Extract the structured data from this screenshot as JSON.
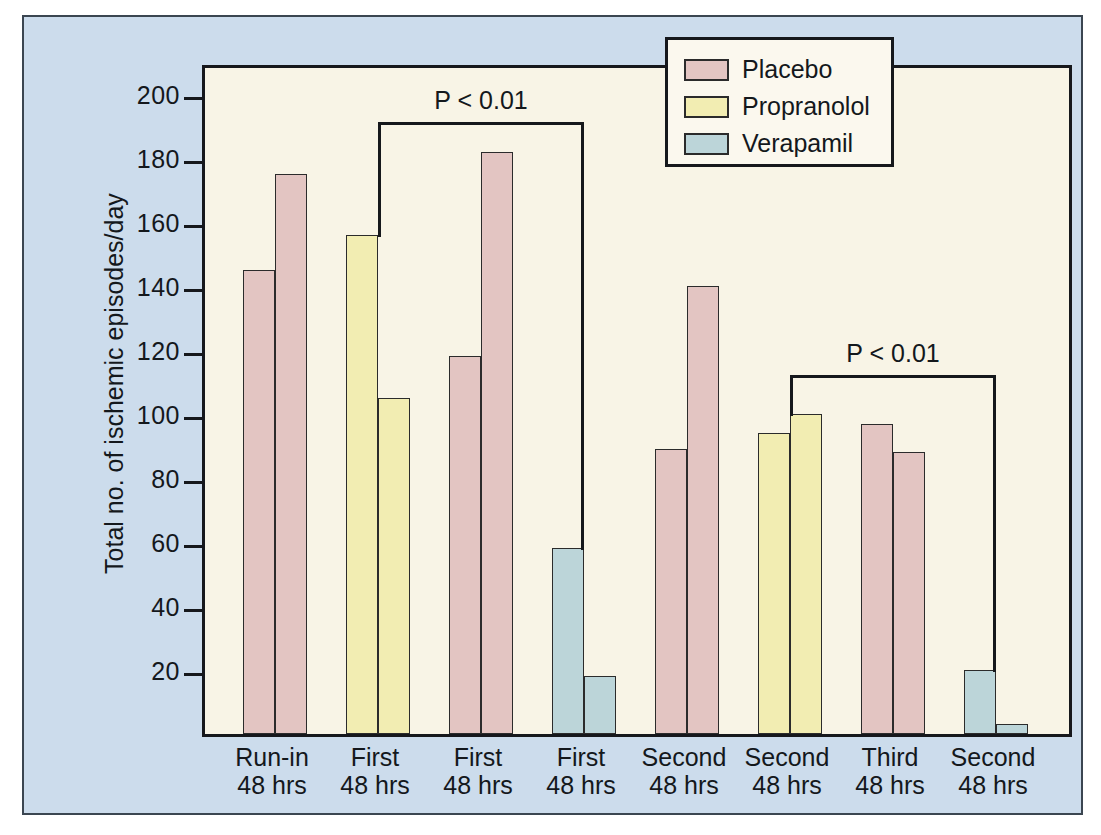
{
  "chart_data": {
    "type": "bar",
    "title": "",
    "xlabel": "",
    "ylabel": "Total no. of ischemic episodes/day",
    "ylim": [
      0,
      210
    ],
    "yticks": [
      20,
      40,
      60,
      80,
      100,
      120,
      140,
      160,
      180,
      200
    ],
    "grid": false,
    "legend_position": "top-right",
    "legend": [
      {
        "name": "Placebo",
        "color": "#e3c5c2"
      },
      {
        "name": "Propranolol",
        "color": "#f2edb2"
      },
      {
        "name": "Verapamil",
        "color": "#bcd5d9"
      }
    ],
    "categories": [
      {
        "line1": "Run-in",
        "line2": "48 hrs"
      },
      {
        "line1": "First",
        "line2": "48 hrs"
      },
      {
        "line1": "First",
        "line2": "48 hrs"
      },
      {
        "line1": "First",
        "line2": "48 hrs"
      },
      {
        "line1": "Second",
        "line2": "48 hrs"
      },
      {
        "line1": "Second",
        "line2": "48 hrs"
      },
      {
        "line1": "Third",
        "line2": "48 hrs"
      },
      {
        "line1": "Second",
        "line2": "48 hrs"
      }
    ],
    "bars": [
      {
        "group": 0,
        "index": 0,
        "series": "Placebo",
        "value": 145
      },
      {
        "group": 0,
        "index": 1,
        "series": "Placebo",
        "value": 175
      },
      {
        "group": 1,
        "index": 0,
        "series": "Propranolol",
        "value": 156
      },
      {
        "group": 1,
        "index": 1,
        "series": "Propranolol",
        "value": 105
      },
      {
        "group": 2,
        "index": 0,
        "series": "Placebo",
        "value": 118
      },
      {
        "group": 2,
        "index": 1,
        "series": "Placebo",
        "value": 182
      },
      {
        "group": 3,
        "index": 0,
        "series": "Verapamil",
        "value": 58
      },
      {
        "group": 3,
        "index": 1,
        "series": "Verapamil",
        "value": 18
      },
      {
        "group": 4,
        "index": 0,
        "series": "Placebo",
        "value": 89
      },
      {
        "group": 4,
        "index": 1,
        "series": "Placebo",
        "value": 140
      },
      {
        "group": 5,
        "index": 0,
        "series": "Propranolol",
        "value": 94
      },
      {
        "group": 5,
        "index": 1,
        "series": "Propranolol",
        "value": 100
      },
      {
        "group": 6,
        "index": 0,
        "series": "Placebo",
        "value": 97
      },
      {
        "group": 6,
        "index": 1,
        "series": "Placebo",
        "value": 88
      },
      {
        "group": 7,
        "index": 0,
        "series": "Verapamil",
        "value": 20
      },
      {
        "group": 7,
        "index": 1,
        "series": "Verapamil",
        "value": 3
      }
    ],
    "annotations": [
      {
        "label": "P < 0.01",
        "from_group": 1,
        "to_group": 3,
        "y": 193
      },
      {
        "label": "P < 0.01",
        "from_group": 5,
        "to_group": 7,
        "y": 114
      }
    ]
  },
  "colors": {
    "placebo": "#e3c5c2",
    "propranolol": "#f2edb2",
    "verapamil": "#bcd5d9",
    "plot_background": "#f8f4e6",
    "panel_background": "#ccdcec",
    "axis": "#16181c"
  }
}
